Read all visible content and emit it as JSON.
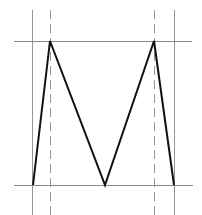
{
  "diagram": {
    "width": 202,
    "height": 215,
    "colors": {
      "background": "#ffffff",
      "shape_stroke": "#111111",
      "guide_stroke": "#8a8a8a"
    },
    "horizontal_guides": [
      {
        "name": "top-baseline",
        "x1": 14,
        "x2": 192,
        "y": 41
      },
      {
        "name": "bottom-baseline",
        "x1": 14,
        "x2": 193,
        "y": 185
      }
    ],
    "vertical_guides": [
      {
        "name": "left-solid-guide",
        "x": 32,
        "y1": 10,
        "y2": 215,
        "style": "solid"
      },
      {
        "name": "left-dashed-guide",
        "x": 50,
        "y1": 10,
        "y2": 215,
        "style": "dashed"
      },
      {
        "name": "right-dashed-guide",
        "x": 154,
        "y1": 10,
        "y2": 215,
        "style": "dashed"
      },
      {
        "name": "right-solid-guide",
        "x": 174,
        "y1": 10,
        "y2": 215,
        "style": "solid"
      }
    ],
    "m_shape": {
      "points": [
        [
          33,
          185
        ],
        [
          50,
          41
        ],
        [
          105,
          185
        ],
        [
          154,
          41
        ],
        [
          174,
          185
        ]
      ],
      "stroke_width": 2
    }
  }
}
